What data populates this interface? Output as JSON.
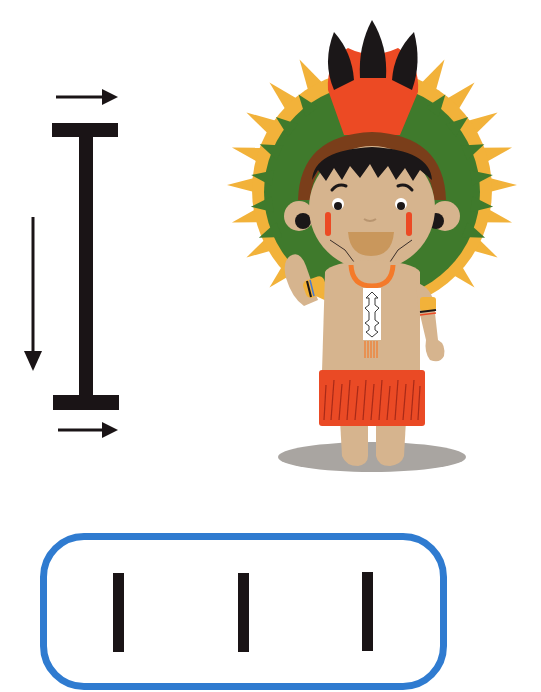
{
  "worksheet": {
    "stroke_diagram": {
      "letter": "I",
      "stroke_order": [
        {
          "step": 1,
          "direction": "left-to-right",
          "part": "top bar"
        },
        {
          "step": 2,
          "direction": "top-to-bottom",
          "part": "vertical stem"
        },
        {
          "step": 3,
          "direction": "left-to-right",
          "part": "bottom bar"
        }
      ],
      "ink_color": "#1a1416"
    },
    "illustration": {
      "subject": "Indigenous child with feathered headdress, waving",
      "colors": {
        "skin": "#d6b48e",
        "headdress_green": "#3f7a2c",
        "headdress_yellow": "#f2b23a",
        "headdress_red": "#ec4a24",
        "feather_black": "#1b1718",
        "headband_brown": "#7a3e1a",
        "skirt_red": "#ea4a25",
        "necklace_orange": "#f47a2a",
        "shadow": "#a9a5a1"
      }
    },
    "practice_box": {
      "border_color": "#2f7bd0",
      "strokes": [
        "I",
        "I",
        "I"
      ],
      "stroke_color": "#1a1416"
    }
  }
}
